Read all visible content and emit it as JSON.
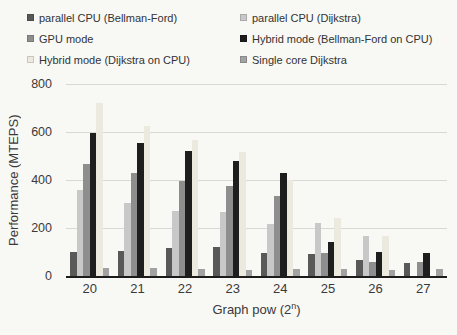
{
  "chart_data": {
    "type": "bar",
    "title": "",
    "xlabel": "Graph pow (2ⁿ)",
    "xlabel_prefix": "Graph pow (2",
    "xlabel_sup": "n",
    "xlabel_suffix": ")",
    "ylabel": "Performance (MTEPS)",
    "ylim": [
      0,
      800
    ],
    "ytick_step": 200,
    "yticks": [
      0,
      200,
      400,
      600,
      800
    ],
    "grid": "horizontal",
    "legend_position": "top-two-columns",
    "categories": [
      "20",
      "21",
      "22",
      "23",
      "24",
      "25",
      "26",
      "27"
    ],
    "series": [
      {
        "name": "parallel CPU (Bellman-Ford)",
        "color": "#595959",
        "values": [
          100,
          105,
          115,
          120,
          95,
          90,
          65,
          55
        ]
      },
      {
        "name": "parallel CPU (Dijkstra)",
        "color": "#c8c8c8",
        "values": [
          360,
          305,
          270,
          265,
          215,
          220,
          165,
          0
        ]
      },
      {
        "name": "GPU mode",
        "color": "#8e8e8e",
        "values": [
          465,
          430,
          395,
          375,
          335,
          95,
          60,
          60
        ]
      },
      {
        "name": "Hybrid mode (Bellman-Ford on CPU)",
        "color": "#1e1e1e",
        "values": [
          595,
          555,
          520,
          480,
          430,
          140,
          100,
          95
        ]
      },
      {
        "name": "Hybrid mode (Dijkstra on CPU)",
        "color": "#eceade",
        "values": [
          720,
          625,
          565,
          515,
          400,
          240,
          165,
          0
        ]
      },
      {
        "name": "Single core Dijkstra",
        "color": "#a2a2a2",
        "values": [
          35,
          35,
          30,
          25,
          30,
          30,
          25,
          30
        ]
      }
    ]
  }
}
